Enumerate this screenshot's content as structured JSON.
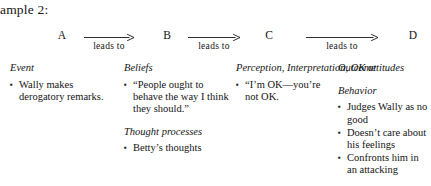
{
  "title": "xample 2:",
  "chain": {
    "nodes": [
      {
        "label": "A",
        "x": 55
      },
      {
        "label": "B",
        "x": 160
      },
      {
        "label": "C",
        "x": 262
      },
      {
        "label": "D",
        "x": 406
      }
    ],
    "arrows": [
      {
        "label": "leads to",
        "x": 84,
        "width": 50
      },
      {
        "label": "leads to",
        "x": 188,
        "width": 52
      },
      {
        "label": "leads to",
        "x": 306,
        "width": 72
      }
    ]
  },
  "columns": [
    {
      "x": 10,
      "width": 105,
      "blocks": [
        {
          "heading": "Event",
          "items": [
            "Wally makes derogatory remarks."
          ]
        }
      ]
    },
    {
      "x": 124,
      "width": 108,
      "blocks": [
        {
          "heading": "Beliefs",
          "items": [
            "“People ought to behave the way I think they should.”"
          ]
        },
        {
          "heading": "Thought processes",
          "items": [
            "Betty’s thoughts"
          ]
        }
      ]
    },
    {
      "x": 236,
      "width": 96,
      "blocks": [
        {
          "heading": "Perception, Interpretation, OK attitudes",
          "items": [
            "“I’m OK—you’re not OK."
          ]
        }
      ]
    },
    {
      "x": 338,
      "width": 93,
      "blocks": [
        {
          "heading": "Outcome",
          "items": []
        },
        {
          "heading": "Behavior",
          "items": [
            "Judges Wally as no good",
            "Doesn’t care about his feelings",
            "Confronts him in an attacking"
          ]
        }
      ]
    }
  ],
  "bullet_glyph": "▪"
}
